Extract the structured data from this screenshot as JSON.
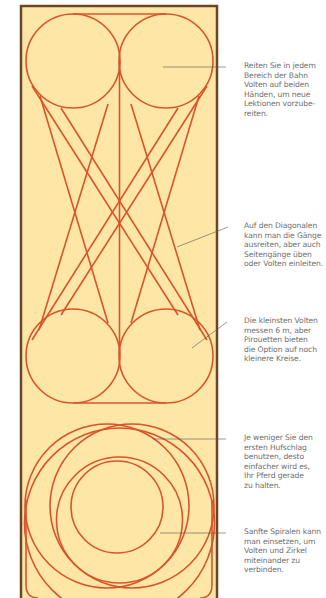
{
  "diagram": {
    "title": "",
    "type": "riding-arena-figures",
    "colors": {
      "arena_fill": "#fde6a6",
      "arena_border": "#6b4626",
      "figure_lines": "#d9542a",
      "leader_lines": "#555555",
      "text": "#6e6e6e"
    },
    "figures": [
      {
        "name": "volte-top-left",
        "shape": "circle"
      },
      {
        "name": "volte-top-right",
        "shape": "circle"
      },
      {
        "name": "center-line",
        "shape": "line"
      },
      {
        "name": "diagonals",
        "shape": "lines"
      },
      {
        "name": "volte-middle-left",
        "shape": "circle"
      },
      {
        "name": "volte-middle-right",
        "shape": "circle"
      },
      {
        "name": "large-circles-lower",
        "shape": "circles"
      },
      {
        "name": "spiral-inner-circle",
        "shape": "circle"
      }
    ],
    "annotations": [
      {
        "id": "a1",
        "text": "Reiten Sie in jedem Bereich der Bahn Volten auf beiden Händen, um neue Lektionen vorzube-reiten.",
        "lines": [
          "Reiten Sie in jedem",
          "Bereich der Bahn",
          "Volten auf beiden",
          "Händen, um neue",
          "Lektionen vorzube-",
          "reiten."
        ]
      },
      {
        "id": "a2",
        "text": "Auf den Diagonalen kann man die Gänge ausreiten, aber auch Seitengänge üben oder Volten einleiten.",
        "lines": [
          "Auf den Diagonalen",
          "kann man die Gänge",
          "ausreiten, aber auch",
          "Seitengänge üben",
          "oder Volten einleiten."
        ]
      },
      {
        "id": "a3",
        "text": "Die kleinsten Volten messen 6 m, aber Pirouetten bieten die Option auf noch kleinere Kreise.",
        "lines": [
          "Die kleinsten Volten",
          "messen 6 m, aber",
          "Pirouetten bieten",
          "die Option auf noch",
          "kleinere Kreise."
        ]
      },
      {
        "id": "a4",
        "text": "Je weniger Sie den ersten Hufschlag benutzen, desto einfacher wird es, Ihr Pferd gerade zu halten.",
        "lines": [
          "Je weniger Sie den",
          "ersten Hufschlag",
          "benutzen, desto",
          "einfacher wird es,",
          "Ihr Pferd gerade",
          "zu halten."
        ]
      },
      {
        "id": "a5",
        "text": "Sanfte Spiralen kann man einsetzen, um Volten und Zirkel miteinander zu verbinden.",
        "lines": [
          "Sanfte Spiralen kann",
          "man einsetzen, um",
          "Volten und Zirkel",
          "miteinander zu",
          "verbinden."
        ]
      }
    ]
  }
}
